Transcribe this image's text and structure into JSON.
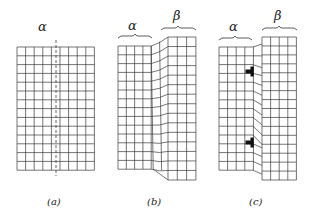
{
  "figure": {
    "panels": [
      {
        "id": "a",
        "label": "(a)",
        "phase_labels": [
          "α"
        ],
        "description": "Undistorted square lattice with dashed vertical line marking future interface"
      },
      {
        "id": "b",
        "label": "(b)",
        "phase_labels": [
          "α",
          "β"
        ],
        "description": "Coherent shear transformation: α and β joined by sheared lattice region"
      },
      {
        "id": "c",
        "label": "(c)",
        "phase_labels": [
          "α",
          "β"
        ],
        "description": "Semicoherent interface with misfit dislocations"
      }
    ],
    "dislocation_symbol": "⊣",
    "dislocation_count_panel_c": 2,
    "colors": {
      "line": "#3a3a3a",
      "background": "#ffffff"
    }
  }
}
